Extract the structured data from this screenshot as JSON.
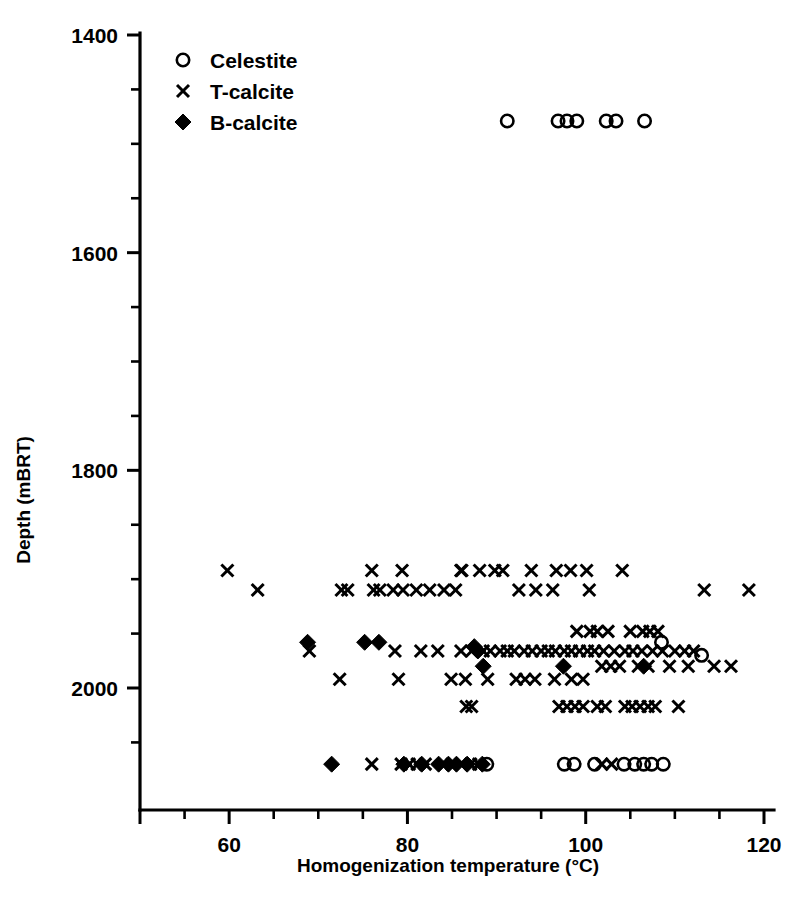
{
  "figure": {
    "background": "#ffffff",
    "foreground": "#000000",
    "width": 787,
    "height": 905
  },
  "axes": {
    "x_label": "Homogenization temperature (°C)",
    "y_label": "Depth (mBRT)",
    "x_ticks": [
      "60",
      "80",
      "100",
      "120"
    ],
    "y_ticks": [
      "1400",
      "1600",
      "1800",
      "2000"
    ]
  },
  "legend": {
    "position": "top-left-inside",
    "entries": [
      {
        "label": "Celestite",
        "marker": "open-circle"
      },
      {
        "label": "T-calcite",
        "marker": "cross-x"
      },
      {
        "label": "B-calcite",
        "marker": "filled-diamond"
      }
    ]
  },
  "chart_data": {
    "type": "scatter",
    "title": "",
    "xlabel": "Homogenization temperature (°C)",
    "ylabel": "Depth (mBRT)",
    "xlim": [
      50,
      120
    ],
    "ylim": [
      2085,
      1390
    ],
    "y_inverted": true,
    "grid": false,
    "legend_position": "top-left-inside",
    "x_ticks_major": [
      60,
      80,
      100,
      120
    ],
    "x_ticks_minor": [
      55,
      65,
      70,
      75,
      85,
      90,
      95,
      105,
      110,
      115
    ],
    "y_ticks_major": [
      1400,
      1600,
      1800,
      2000
    ],
    "y_ticks_minor": [
      1450,
      1500,
      1550,
      1650,
      1700,
      1750,
      1850,
      1900,
      1950,
      2050
    ],
    "series": [
      {
        "name": "Celestite",
        "marker": "open-circle",
        "points": [
          [
            91.2,
            1479
          ],
          [
            96.9,
            1479
          ],
          [
            97.9,
            1479
          ],
          [
            99.0,
            1479
          ],
          [
            102.3,
            1479
          ],
          [
            103.4,
            1479
          ],
          [
            106.6,
            1479
          ],
          [
            108.5,
            1958
          ],
          [
            113.0,
            1970
          ],
          [
            88.9,
            2070
          ],
          [
            97.6,
            2070
          ],
          [
            98.7,
            2070
          ],
          [
            101.0,
            2070
          ],
          [
            104.3,
            2070
          ],
          [
            105.5,
            2070
          ],
          [
            106.5,
            2070
          ],
          [
            107.4,
            2070
          ],
          [
            108.7,
            2070
          ]
        ]
      },
      {
        "name": "T-calcite",
        "marker": "cross-x",
        "points": [
          [
            59.8,
            1892
          ],
          [
            76.0,
            1892
          ],
          [
            79.4,
            1892
          ],
          [
            86.0,
            1892
          ],
          [
            86.1,
            1892
          ],
          [
            88.1,
            1892
          ],
          [
            89.8,
            1892
          ],
          [
            90.7,
            1892
          ],
          [
            93.9,
            1892
          ],
          [
            96.7,
            1892
          ],
          [
            98.3,
            1892
          ],
          [
            100.1,
            1892
          ],
          [
            104.1,
            1892
          ],
          [
            63.2,
            1910
          ],
          [
            72.6,
            1910
          ],
          [
            73.3,
            1910
          ],
          [
            76.2,
            1910
          ],
          [
            76.9,
            1910
          ],
          [
            78.4,
            1910
          ],
          [
            79.5,
            1910
          ],
          [
            81.0,
            1910
          ],
          [
            82.5,
            1910
          ],
          [
            84.1,
            1910
          ],
          [
            85.4,
            1910
          ],
          [
            92.5,
            1910
          ],
          [
            94.4,
            1910
          ],
          [
            96.3,
            1910
          ],
          [
            100.4,
            1910
          ],
          [
            113.3,
            1910
          ],
          [
            118.3,
            1910
          ],
          [
            99.0,
            1948
          ],
          [
            100.5,
            1948
          ],
          [
            101.3,
            1948
          ],
          [
            102.5,
            1948
          ],
          [
            105.0,
            1948
          ],
          [
            106.4,
            1948
          ],
          [
            107.2,
            1948
          ],
          [
            108.1,
            1948
          ],
          [
            69.0,
            1966
          ],
          [
            78.6,
            1966
          ],
          [
            81.5,
            1966
          ],
          [
            83.4,
            1966
          ],
          [
            86.0,
            1966
          ],
          [
            87.2,
            1966
          ],
          [
            88.5,
            1966
          ],
          [
            89.3,
            1966
          ],
          [
            90.4,
            1966
          ],
          [
            91.2,
            1966
          ],
          [
            92.0,
            1966
          ],
          [
            93.1,
            1966
          ],
          [
            94.0,
            1966
          ],
          [
            95.0,
            1966
          ],
          [
            95.8,
            1966
          ],
          [
            96.6,
            1966
          ],
          [
            97.6,
            1966
          ],
          [
            98.4,
            1966
          ],
          [
            99.3,
            1966
          ],
          [
            100.2,
            1966
          ],
          [
            101.0,
            1966
          ],
          [
            102.0,
            1966
          ],
          [
            103.2,
            1966
          ],
          [
            104.4,
            1966
          ],
          [
            105.3,
            1966
          ],
          [
            106.3,
            1966
          ],
          [
            107.5,
            1966
          ],
          [
            108.6,
            1966
          ],
          [
            110.0,
            1966
          ],
          [
            111.1,
            1966
          ],
          [
            112.1,
            1966
          ],
          [
            101.8,
            1980
          ],
          [
            102.8,
            1980
          ],
          [
            103.8,
            1980
          ],
          [
            105.9,
            1980
          ],
          [
            107.0,
            1980
          ],
          [
            109.4,
            1980
          ],
          [
            111.5,
            1980
          ],
          [
            114.4,
            1980
          ],
          [
            116.3,
            1980
          ],
          [
            72.4,
            1992
          ],
          [
            79.0,
            1992
          ],
          [
            84.9,
            1992
          ],
          [
            86.5,
            1992
          ],
          [
            89.0,
            1992
          ],
          [
            92.2,
            1992
          ],
          [
            93.2,
            1992
          ],
          [
            94.3,
            1992
          ],
          [
            96.5,
            1992
          ],
          [
            98.4,
            1992
          ],
          [
            99.7,
            1992
          ],
          [
            86.6,
            2017
          ],
          [
            87.2,
            2017
          ],
          [
            97.0,
            2017
          ],
          [
            97.9,
            2017
          ],
          [
            98.8,
            2017
          ],
          [
            99.7,
            2017
          ],
          [
            101.3,
            2017
          ],
          [
            102.2,
            2017
          ],
          [
            104.4,
            2017
          ],
          [
            105.2,
            2017
          ],
          [
            106.1,
            2017
          ],
          [
            107.0,
            2017
          ],
          [
            107.8,
            2017
          ],
          [
            110.4,
            2017
          ],
          [
            76.0,
            2070
          ],
          [
            79.3,
            2070
          ],
          [
            80.2,
            2070
          ],
          [
            81.1,
            2070
          ],
          [
            82.0,
            2070
          ],
          [
            85.0,
            2070
          ],
          [
            86.0,
            2070
          ],
          [
            87.1,
            2070
          ],
          [
            88.0,
            2070
          ],
          [
            101.8,
            2070
          ],
          [
            102.9,
            2070
          ]
        ]
      },
      {
        "name": "B-calcite",
        "marker": "filled-diamond",
        "points": [
          [
            68.8,
            1958
          ],
          [
            75.2,
            1958
          ],
          [
            76.8,
            1958
          ],
          [
            87.5,
            1962
          ],
          [
            87.9,
            1966
          ],
          [
            88.5,
            1980
          ],
          [
            97.5,
            1980
          ],
          [
            106.5,
            1980
          ],
          [
            71.5,
            2070
          ],
          [
            79.6,
            2070
          ],
          [
            81.6,
            2070
          ],
          [
            83.5,
            2070
          ],
          [
            84.6,
            2070
          ],
          [
            85.5,
            2070
          ],
          [
            86.7,
            2070
          ],
          [
            88.4,
            2070
          ]
        ]
      }
    ]
  }
}
